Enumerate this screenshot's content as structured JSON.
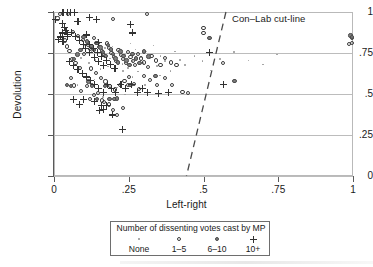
{
  "chart_data": {
    "type": "scatter",
    "title": "",
    "xlabel": "Left-right",
    "ylabel": "Devolution",
    "xlim": [
      0,
      1
    ],
    "ylim": [
      0,
      1
    ],
    "grid": true,
    "xticks": [
      "0",
      ".25",
      ".5",
      ".75",
      "1"
    ],
    "xtick_values": [
      0,
      0.25,
      0.5,
      0.75,
      1
    ],
    "yticks": [
      "0",
      ".25",
      ".5",
      ".75",
      "1"
    ],
    "ytick_values": [
      0,
      0.25,
      0.5,
      0.75,
      1
    ],
    "annotations": [
      {
        "name": "con-lab-cut-line-label",
        "text": "Con–Lab cut-line",
        "x": 0.6,
        "y": 0.975
      }
    ],
    "reference_lines": [
      {
        "name": "con-lab-cut-line",
        "style": "dashed",
        "x_start": 0.575,
        "y_start": 1.0,
        "x_end": 0.443,
        "y_end": 0.0
      }
    ],
    "legend": {
      "position": "below-axes",
      "title": "Number of dissenting votes cast by MP",
      "entries": [
        {
          "label": "None",
          "marker": "tiny-dot"
        },
        {
          "label": "1–5",
          "marker": "open-circle"
        },
        {
          "label": "6–10",
          "marker": "filled-circle"
        },
        {
          "label": "10+",
          "marker": "plus"
        }
      ]
    },
    "series": [
      {
        "name": "None",
        "marker": "tiny-dot",
        "color": "#9a9a9a",
        "points": [
          [
            0.055,
            0.772
          ],
          [
            0.072,
            0.745
          ],
          [
            0.091,
            0.718
          ],
          [
            0.104,
            0.8
          ],
          [
            0.118,
            0.688
          ],
          [
            0.126,
            0.762
          ],
          [
            0.139,
            0.706
          ],
          [
            0.148,
            0.832
          ],
          [
            0.156,
            0.652
          ],
          [
            0.163,
            0.735
          ],
          [
            0.171,
            0.781
          ],
          [
            0.18,
            0.668
          ],
          [
            0.188,
            0.716
          ],
          [
            0.196,
            0.79
          ],
          [
            0.204,
            0.64
          ],
          [
            0.212,
            0.702
          ],
          [
            0.221,
            0.756
          ],
          [
            0.229,
            0.684
          ],
          [
            0.238,
            0.742
          ],
          [
            0.247,
            0.66
          ],
          [
            0.256,
            0.808
          ],
          [
            0.263,
            0.7
          ],
          [
            0.272,
            0.772
          ],
          [
            0.281,
            0.636
          ],
          [
            0.291,
            0.724
          ],
          [
            0.3,
            0.688
          ],
          [
            0.31,
            0.76
          ],
          [
            0.322,
            0.716
          ],
          [
            0.333,
            0.796
          ],
          [
            0.344,
            0.672
          ],
          [
            0.356,
            0.732
          ],
          [
            0.372,
            0.7
          ],
          [
            0.389,
            0.64
          ],
          [
            0.404,
            0.76
          ],
          [
            0.421,
            0.708
          ],
          [
            0.438,
            0.676
          ],
          [
            0.47,
            0.732
          ],
          [
            0.496,
            0.7
          ],
          [
            0.523,
            0.644
          ],
          [
            0.556,
            0.712
          ],
          [
            0.602,
            0.756
          ],
          [
            0.651,
            0.704
          ],
          [
            0.699,
            0.68
          ],
          [
            0.745,
            0.74
          ],
          [
            0.188,
            0.472
          ],
          [
            0.21,
            0.54
          ],
          [
            0.238,
            0.496
          ],
          [
            0.136,
            0.588
          ],
          [
            0.108,
            0.624
          ],
          [
            0.079,
            0.556
          ],
          [
            0.305,
            0.556
          ],
          [
            0.262,
            0.604
          ],
          [
            0.355,
            0.612
          ],
          [
            0.23,
            0.64
          ],
          [
            0.163,
            0.48
          ]
        ]
      },
      {
        "name": "1-5",
        "marker": "open-circle",
        "color": "#3b3b3b",
        "points": [
          [
            0.021,
            0.99
          ],
          [
            0.046,
            0.988
          ],
          [
            0.012,
            0.96
          ],
          [
            0.064,
            0.88
          ],
          [
            0.08,
            0.855
          ],
          [
            0.098,
            0.828
          ],
          [
            0.113,
            0.8
          ],
          [
            0.12,
            0.776
          ],
          [
            0.134,
            0.84
          ],
          [
            0.142,
            0.812
          ],
          [
            0.152,
            0.788
          ],
          [
            0.16,
            0.76
          ],
          [
            0.168,
            0.736
          ],
          [
            0.176,
            0.808
          ],
          [
            0.184,
            0.78
          ],
          [
            0.192,
            0.752
          ],
          [
            0.2,
            0.724
          ],
          [
            0.208,
            0.7
          ],
          [
            0.216,
            0.768
          ],
          [
            0.224,
            0.74
          ],
          [
            0.232,
            0.712
          ],
          [
            0.24,
            0.688
          ],
          [
            0.248,
            0.756
          ],
          [
            0.256,
            0.728
          ],
          [
            0.264,
            0.7
          ],
          [
            0.272,
            0.676
          ],
          [
            0.282,
            0.744
          ],
          [
            0.292,
            0.716
          ],
          [
            0.302,
            0.692
          ],
          [
            0.314,
            0.664
          ],
          [
            0.326,
            0.732
          ],
          [
            0.34,
            0.704
          ],
          [
            0.356,
            0.676
          ],
          [
            0.372,
            0.72
          ],
          [
            0.39,
            0.692
          ],
          [
            0.41,
            0.676
          ],
          [
            0.196,
            0.955
          ],
          [
            0.31,
            0.99
          ],
          [
            0.5,
            0.9
          ],
          [
            0.5,
            0.872
          ],
          [
            0.06,
            0.712
          ],
          [
            0.072,
            0.688
          ],
          [
            0.088,
            0.66
          ],
          [
            0.1,
            0.744
          ],
          [
            0.044,
            0.79
          ],
          [
            0.036,
            0.826
          ],
          [
            0.052,
            0.76
          ],
          [
            0.124,
            0.656
          ],
          [
            0.14,
            0.628
          ],
          [
            0.156,
            0.6
          ],
          [
            0.172,
            0.576
          ],
          [
            0.188,
            0.548
          ],
          [
            0.204,
            0.528
          ],
          [
            0.22,
            0.556
          ],
          [
            0.236,
            0.58
          ],
          [
            0.252,
            0.604
          ],
          [
            0.268,
            0.56
          ],
          [
            0.284,
            0.532
          ],
          [
            0.3,
            0.608
          ],
          [
            0.32,
            0.584
          ],
          [
            0.344,
            0.556
          ],
          [
            0.37,
            0.6
          ],
          [
            0.396,
            0.556
          ],
          [
            0.43,
            0.512
          ],
          [
            0.448,
            0.508
          ],
          [
            0.11,
            0.548
          ],
          [
            0.09,
            0.52
          ],
          [
            0.135,
            0.496
          ],
          [
            0.16,
            0.46
          ],
          [
            0.184,
            0.436
          ],
          [
            0.196,
            0.4
          ],
          [
            0.21,
            0.372
          ],
          [
            0.232,
            0.416
          ],
          [
            0.248,
            0.556
          ],
          [
            0.992,
            0.852
          ],
          [
            0.998,
            0.84
          ],
          [
            0.996,
            0.812
          ],
          [
            0.986,
            0.806
          ],
          [
            0.564,
            0.688
          ],
          [
            0.12,
            0.468
          ],
          [
            0.168,
            0.452
          ],
          [
            0.146,
            0.508
          ],
          [
            0.068,
            0.552
          ],
          [
            0.056,
            0.6
          ]
        ]
      },
      {
        "name": "6-10",
        "marker": "filled-circle",
        "color": "#7d7d7d",
        "points": [
          [
            0.098,
            0.848
          ],
          [
            0.11,
            0.82
          ],
          [
            0.125,
            0.792
          ],
          [
            0.134,
            0.768
          ],
          [
            0.146,
            0.812
          ],
          [
            0.155,
            0.784
          ],
          [
            0.164,
            0.756
          ],
          [
            0.172,
            0.732
          ],
          [
            0.18,
            0.8
          ],
          [
            0.19,
            0.772
          ],
          [
            0.198,
            0.744
          ],
          [
            0.206,
            0.716
          ],
          [
            0.214,
            0.692
          ],
          [
            0.222,
            0.76
          ],
          [
            0.232,
            0.732
          ],
          [
            0.242,
            0.704
          ],
          [
            0.252,
            0.676
          ],
          [
            0.262,
            0.744
          ],
          [
            0.274,
            0.716
          ],
          [
            0.286,
            0.688
          ],
          [
            0.3,
            0.76
          ],
          [
            0.316,
            0.728
          ],
          [
            0.088,
            0.768
          ],
          [
            0.078,
            0.74
          ],
          [
            0.066,
            0.712
          ],
          [
            0.056,
            0.548
          ],
          [
            0.044,
            0.556
          ],
          [
            0.17,
            0.548
          ],
          [
            0.186,
            0.47
          ],
          [
            0.202,
            0.468
          ],
          [
            0.21,
            0.472
          ],
          [
            0.128,
            0.552
          ],
          [
            0.116,
            0.576
          ],
          [
            0.144,
            0.468
          ],
          [
            0.52,
            0.84
          ],
          [
            0.604,
            0.58
          ],
          [
            0.992,
            0.856
          ],
          [
            0.996,
            0.848
          ],
          [
            0.256,
            0.556
          ],
          [
            0.34,
            0.608
          ]
        ]
      },
      {
        "name": "10+",
        "marker": "plus",
        "color": "#323232",
        "points": [
          [
            0.03,
            0.995
          ],
          [
            0.044,
            0.995
          ],
          [
            0.056,
            0.995
          ],
          [
            0.068,
            0.995
          ],
          [
            0.004,
            0.952
          ],
          [
            0.028,
            0.93
          ],
          [
            0.034,
            0.908
          ],
          [
            0.04,
            0.886
          ],
          [
            0.046,
            0.864
          ],
          [
            0.028,
            0.872
          ],
          [
            0.022,
            0.848
          ],
          [
            0.016,
            0.832
          ],
          [
            0.03,
            0.82
          ],
          [
            0.044,
            0.852
          ],
          [
            0.058,
            0.876
          ],
          [
            0.072,
            0.852
          ],
          [
            0.086,
            0.828
          ],
          [
            0.1,
            0.8
          ],
          [
            0.104,
            0.776
          ],
          [
            0.118,
            0.8
          ],
          [
            0.132,
            0.776
          ],
          [
            0.146,
            0.752
          ],
          [
            0.16,
            0.728
          ],
          [
            0.12,
            0.752
          ],
          [
            0.136,
            0.724
          ],
          [
            0.15,
            0.7
          ],
          [
            0.164,
            0.676
          ],
          [
            0.176,
            0.704
          ],
          [
            0.19,
            0.68
          ],
          [
            0.204,
            0.656
          ],
          [
            0.142,
            0.952
          ],
          [
            0.256,
            0.924
          ],
          [
            0.262,
            0.872
          ],
          [
            0.08,
            0.94
          ],
          [
            0.118,
            0.964
          ],
          [
            0.052,
            0.7
          ],
          [
            0.066,
            0.676
          ],
          [
            0.08,
            0.652
          ],
          [
            0.094,
            0.628
          ],
          [
            0.108,
            0.604
          ],
          [
            0.122,
            0.58
          ],
          [
            0.136,
            0.556
          ],
          [
            0.15,
            0.532
          ],
          [
            0.164,
            0.508
          ],
          [
            0.178,
            0.556
          ],
          [
            0.192,
            0.532
          ],
          [
            0.206,
            0.508
          ],
          [
            0.224,
            0.556
          ],
          [
            0.24,
            0.532
          ],
          [
            0.258,
            0.556
          ],
          [
            0.278,
            0.508
          ],
          [
            0.296,
            0.532
          ],
          [
            0.314,
            0.508
          ],
          [
            0.35,
            0.504
          ],
          [
            0.384,
            0.508
          ],
          [
            0.066,
            0.464
          ],
          [
            0.084,
            0.436
          ],
          [
            0.1,
            0.468
          ],
          [
            0.136,
            0.452
          ],
          [
            0.158,
            0.432
          ],
          [
            0.166,
            0.404
          ],
          [
            0.152,
            0.4
          ],
          [
            0.176,
            0.432
          ],
          [
            0.196,
            0.372
          ],
          [
            0.228,
            0.284
          ],
          [
            0.52,
            0.752
          ],
          [
            0.566,
            0.556
          ],
          [
            0.148,
            0.812
          ],
          [
            0.108,
            0.86
          ]
        ]
      }
    ]
  },
  "axes": {
    "y_title": "Devolution",
    "x_title": "Left-right",
    "y_labels": [
      "1",
      ".75",
      ".5",
      ".25",
      "0"
    ],
    "x_labels": [
      "0",
      ".25",
      ".5",
      ".75",
      "1"
    ]
  },
  "cutline": {
    "label": "Con–Lab cut-line"
  },
  "legend": {
    "title": "Number of dissenting votes cast by MP",
    "items": [
      {
        "label": "None",
        "marker": "tiny-dot-marker"
      },
      {
        "label": "1–5",
        "marker": "open-circle-marker"
      },
      {
        "label": "6–10",
        "marker": "filled-circle-marker"
      },
      {
        "label": "10+",
        "marker": "plus-marker"
      }
    ]
  },
  "colors": {
    "grid": "#bcbcbc",
    "axis": "#5a5a5a",
    "frame": "#b9b9b9",
    "marker_none": "#9a9a9a",
    "marker_open": "#3b3b3b",
    "marker_solid": "#7d7d7d",
    "marker_plus": "#323232",
    "cutline": "#4a4a4a",
    "text": "#1a1a1a"
  }
}
